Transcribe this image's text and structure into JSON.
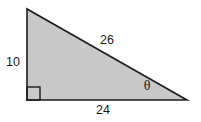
{
  "figure": {
    "type": "right-triangle-diagram",
    "labels": {
      "left_side": "10",
      "hypotenuse": "26",
      "bottom_side": "24",
      "angle": "θ"
    },
    "colors": {
      "fill": "#c8c8c8",
      "stroke": "#1c1c1c",
      "background": "#ffffff",
      "text": "#1a1a1a"
    }
  }
}
